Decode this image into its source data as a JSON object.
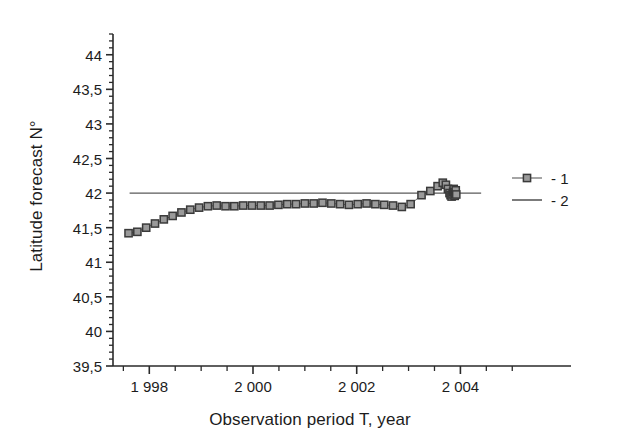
{
  "chart_data": {
    "type": "scatter",
    "title": "",
    "xlabel": "Observation period T, year",
    "ylabel": "Latitude forecast N°",
    "xlim": [
      1997.3,
      2005.4
    ],
    "ylim": [
      39.5,
      44.3
    ],
    "grid": false,
    "legend_position": "right",
    "ytick_labels": [
      "39,5",
      "40",
      "40,5",
      "41",
      "41,5",
      "42",
      "42,5",
      "43",
      "43,5",
      "44"
    ],
    "ytick_values": [
      39.5,
      40,
      40.5,
      41,
      41.5,
      42,
      42.5,
      43,
      43.5,
      44
    ],
    "yminor_step": 0.1,
    "xtick_labels": [
      "1 998",
      "2 000",
      "2 002",
      "2 004"
    ],
    "xtick_values": [
      1998,
      2000,
      2002,
      2004
    ],
    "xminor_step": 0.5,
    "series": [
      {
        "name": "1",
        "legend_label": "- 1",
        "marker": "square",
        "marker_fill": "#9a9a9a",
        "marker_edge": "#3a3a3a",
        "line_color": "#6a6a6a",
        "x": [
          1997.6,
          1997.77,
          1997.94,
          1998.11,
          1998.28,
          1998.45,
          1998.62,
          1998.79,
          1998.96,
          1999.13,
          1999.3,
          1999.47,
          1999.64,
          1999.81,
          1999.98,
          2000.15,
          2000.32,
          2000.49,
          2000.66,
          2000.83,
          2001.0,
          2001.17,
          2001.34,
          2001.51,
          2001.68,
          2001.85,
          2002.02,
          2002.19,
          2002.36,
          2002.53,
          2002.7,
          2002.87,
          2003.04,
          2003.25,
          2003.42,
          2003.56,
          2003.66,
          2003.72,
          2003.76,
          2003.79,
          2003.81,
          2003.83,
          2003.85,
          2003.86,
          2003.87,
          2003.88,
          2003.89,
          2003.9,
          2003.91,
          2003.92
        ],
        "y": [
          41.42,
          41.44,
          41.5,
          41.56,
          41.62,
          41.67,
          41.72,
          41.76,
          41.79,
          41.81,
          41.82,
          41.81,
          41.81,
          41.82,
          41.82,
          41.82,
          41.82,
          41.83,
          41.84,
          41.84,
          41.85,
          41.85,
          41.86,
          41.85,
          41.84,
          41.83,
          41.84,
          41.85,
          41.84,
          41.83,
          41.82,
          41.8,
          41.84,
          41.97,
          42.03,
          42.1,
          42.15,
          42.12,
          42.06,
          42.0,
          41.97,
          41.95,
          41.98,
          42.02,
          42.06,
          42.01,
          41.96,
          41.99,
          42.04,
          41.98
        ]
      },
      {
        "name": "2",
        "legend_label": "- 2",
        "marker": "none",
        "line_color": "#5a5a5a",
        "type": "reference-line",
        "y_value": 42.0,
        "x_start": 1997.62,
        "x_end": 2004.4
      }
    ]
  },
  "legend": {
    "entries": [
      {
        "label": "- 1",
        "symbol": "square-with-line"
      },
      {
        "label": "- 2",
        "symbol": "line"
      }
    ]
  }
}
